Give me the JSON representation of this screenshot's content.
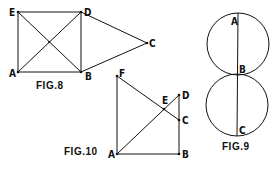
{
  "figures": {
    "fig8": {
      "caption": "FIG.8",
      "points": {
        "E": "E",
        "D": "D",
        "A": "A",
        "B": "B",
        "C": "C"
      }
    },
    "fig9": {
      "caption": "FIG.9",
      "points": {
        "A": "A",
        "B": "B",
        "C": "C"
      }
    },
    "fig10": {
      "caption": "FIG.10",
      "points": {
        "F": "F",
        "E": "E",
        "D": "D",
        "C": "C",
        "A": "A",
        "B": "B"
      }
    }
  },
  "colors": {
    "ink": "#111111",
    "background": "#ffffff"
  }
}
